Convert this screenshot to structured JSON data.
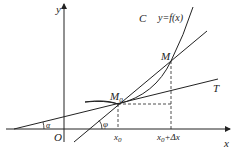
{
  "diagram": {
    "type": "tangent-secant-derivative",
    "labels": {
      "y_axis": "y",
      "x_axis": "x",
      "origin": "O",
      "curve_name": "C",
      "curve_eq": "y=f(x)",
      "point_m": "M",
      "point_m0": "M",
      "point_m0_sub": "0",
      "tangent": "T",
      "angle_alpha": "α",
      "angle_phi": "φ",
      "x0": "x",
      "x0_sub": "0",
      "x0_dx_pre": "x",
      "x0_dx_sub": "0",
      "x0_dx_post": "+Δx"
    },
    "colors": {
      "line": "#222222",
      "background": "#ffffff"
    }
  }
}
